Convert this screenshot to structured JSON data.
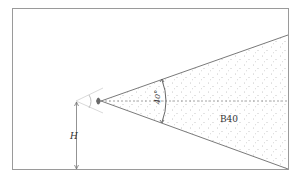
{
  "diagram": {
    "type": "viewing-cone",
    "angle_label": "40°",
    "region_label": "B40",
    "height_label": "H",
    "colors": {
      "frame": "#9a9a9a",
      "rays": "#7a7a7a",
      "fill": "#f4f4f4",
      "dots": "#8a8a8a",
      "eye": "#6a6a6a",
      "text": "#333333"
    }
  }
}
